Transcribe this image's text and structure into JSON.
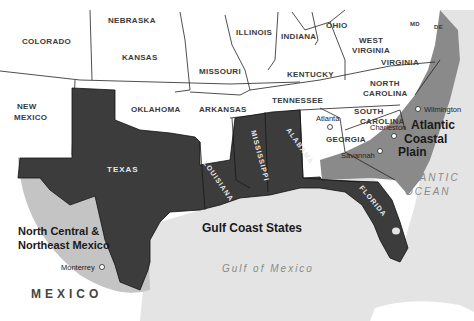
{
  "map": {
    "colors": {
      "land": "#ffffff",
      "ocean": "#e4e4e4",
      "gulf_states": "#3c3c3c",
      "coastal_plain": "#8a8a8a",
      "mexico_region": "#c4c4c4",
      "border": "#222222"
    },
    "states": {
      "colorado": "COLORADO",
      "nebraska": "NEBRASKA",
      "kansas": "KANSAS",
      "new_mexico_1": "NEW",
      "new_mexico_2": "MEXICO",
      "oklahoma": "OKLAHOMA",
      "missouri": "MISSOURI",
      "arkansas": "ARKANSAS",
      "illinois": "ILLINOIS",
      "indiana": "INDIANA",
      "ohio": "OHIO",
      "west_virginia_1": "WEST",
      "west_virginia_2": "VIRGINIA",
      "virginia": "VIRGINIA",
      "kentucky": "KENTUCKY",
      "tennessee": "TENNESSEE",
      "north_carolina_1": "NORTH",
      "north_carolina_2": "CAROLINA",
      "south_carolina_1": "SOUTH",
      "south_carolina_2": "CAROLINA",
      "georgia": "GEORGIA",
      "md": "MD",
      "de": "DE",
      "texas": "TEXAS",
      "louisiana": "LOUISIANA",
      "mississippi": "MISSISSIPPI",
      "alabama": "ALABAMA",
      "florida": "FLORIDA"
    },
    "cities": {
      "atlanta": "Atlanta",
      "charleston": "Charleston",
      "savannah": "Savannah",
      "wilmington": "Wilmington",
      "monterrey": "Monterrey"
    },
    "regions": {
      "atlantic_1": "Atlantic",
      "atlantic_2": "Coastal",
      "atlantic_3": "Plain",
      "gulf_coast": "Gulf Coast States",
      "mexico_1": "North Central &",
      "mexico_2": "Northeast Mexico"
    },
    "water": {
      "atlantic_1": "ATLANTIC",
      "atlantic_2": "OCEAN",
      "gulf": "Gulf of Mexico"
    },
    "country": "MEXICO"
  }
}
